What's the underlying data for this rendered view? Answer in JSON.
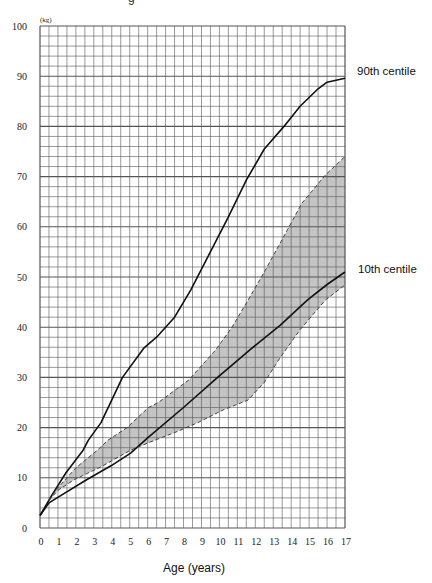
{
  "title_fragment": "g",
  "chart_data": {
    "type": "line",
    "title": "",
    "xlabel": "Age  (years)",
    "ylabel": "(kg)",
    "xlim": [
      0,
      17
    ],
    "ylim": [
      0,
      100
    ],
    "grid": true,
    "x_ticks": [
      "0",
      "1",
      "2",
      "3",
      "4",
      "5",
      "6",
      "7",
      "8",
      "9",
      "10",
      "11",
      "12",
      "13",
      "14",
      "15",
      "16",
      "17"
    ],
    "y_ticks": [
      "0",
      "10",
      "20",
      "30",
      "40",
      "50",
      "60",
      "70",
      "80",
      "90",
      "100"
    ],
    "minor_grid": {
      "x_step": 0.5,
      "y_step": 2
    },
    "series": [
      {
        "name": "90th centile",
        "style": "solid",
        "points": [
          [
            0,
            2.5
          ],
          [
            0.65,
            6.5
          ],
          [
            1.45,
            11
          ],
          [
            2.4,
            15.5
          ],
          [
            2.7,
            17.5
          ],
          [
            3.4,
            21
          ],
          [
            4.6,
            30
          ],
          [
            5.8,
            35.9
          ],
          [
            6.5,
            38
          ],
          [
            7.5,
            42
          ],
          [
            8.4,
            47.4
          ],
          [
            9.5,
            55
          ],
          [
            10.5,
            62
          ],
          [
            11.5,
            69.3
          ],
          [
            12.5,
            75.5
          ],
          [
            13.6,
            80
          ],
          [
            14.5,
            84
          ],
          [
            15.5,
            87.5
          ],
          [
            16,
            88.8
          ],
          [
            17,
            89.6
          ]
        ]
      },
      {
        "name": "10th centile",
        "style": "solid",
        "points": [
          [
            0,
            2.5
          ],
          [
            0.5,
            5
          ],
          [
            0.95,
            6
          ],
          [
            2.6,
            9.6
          ],
          [
            4,
            12.5
          ],
          [
            5.05,
            14.9
          ],
          [
            6.05,
            18.1
          ],
          [
            8,
            24
          ],
          [
            9.9,
            30
          ],
          [
            11.7,
            35.5
          ],
          [
            13.4,
            40.4
          ],
          [
            14.9,
            45.4
          ],
          [
            16,
            48.5
          ],
          [
            17,
            51
          ]
        ]
      },
      {
        "name": "Shaded band upper boundary",
        "style": "dashed",
        "points": [
          [
            0.5,
            5.5
          ],
          [
            0.9,
            7.6
          ],
          [
            2,
            12
          ],
          [
            3.2,
            15.5
          ],
          [
            3.8,
            17.5
          ],
          [
            4.85,
            20
          ],
          [
            6.05,
            24
          ],
          [
            6.6,
            25
          ],
          [
            8.3,
            29.5
          ],
          [
            9.8,
            35.5
          ],
          [
            10.7,
            40
          ],
          [
            11.6,
            45.4
          ],
          [
            12.5,
            51
          ],
          [
            13.5,
            57.5
          ],
          [
            14.6,
            64.7
          ],
          [
            15.9,
            70.3
          ],
          [
            17,
            74
          ]
        ]
      },
      {
        "name": "Shaded band lower boundary",
        "style": "dashed",
        "points": [
          [
            0.5,
            5.5
          ],
          [
            1.0,
            7.5
          ],
          [
            1.9,
            9.6
          ],
          [
            3.4,
            12.2
          ],
          [
            5.05,
            15.5
          ],
          [
            6.05,
            17
          ],
          [
            7.5,
            19
          ],
          [
            8.8,
            21
          ],
          [
            10.2,
            23.5
          ],
          [
            11.6,
            25.5
          ],
          [
            12.5,
            29
          ],
          [
            13.4,
            34
          ],
          [
            14.5,
            39.5
          ],
          [
            15.9,
            45.4
          ],
          [
            17,
            48.4
          ]
        ]
      }
    ],
    "annotations": [
      {
        "text": "90th centile",
        "x": 17,
        "y": 97
      },
      {
        "text": "10th centile",
        "x": 17,
        "y": 53
      }
    ],
    "colors": {
      "band_fill": "#c4c4c4",
      "line": "#111111",
      "grid": "#555555"
    }
  }
}
